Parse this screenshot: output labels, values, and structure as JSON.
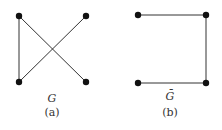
{
  "figures": [
    {
      "id": "a",
      "graph_label": "G",
      "caption": "(a)",
      "nodes": [
        {
          "id": "tl",
          "x": 19,
          "y": 16
        },
        {
          "id": "tr",
          "x": 86,
          "y": 16
        },
        {
          "id": "bl",
          "x": 19,
          "y": 82
        },
        {
          "id": "br",
          "x": 86,
          "y": 82
        }
      ],
      "edges": [
        [
          "tl",
          "bl"
        ],
        [
          "tl",
          "br"
        ],
        [
          "bl",
          "tr"
        ]
      ]
    },
    {
      "id": "b",
      "graph_label": "Ḡ",
      "caption": "(b)",
      "nodes": [
        {
          "id": "tl",
          "x": 138,
          "y": 15
        },
        {
          "id": "tr",
          "x": 206,
          "y": 15
        },
        {
          "id": "bl",
          "x": 138,
          "y": 83
        },
        {
          "id": "br",
          "x": 206,
          "y": 83
        }
      ],
      "edges": [
        [
          "tl",
          "tr"
        ],
        [
          "tr",
          "br"
        ],
        [
          "bl",
          "br"
        ]
      ]
    }
  ],
  "style": {
    "node_color": "#111111",
    "edge_color": "#333333"
  }
}
